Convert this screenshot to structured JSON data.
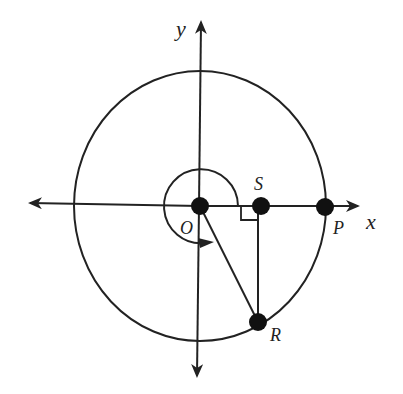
{
  "diagram": {
    "type": "unit-circle-geometry",
    "colors": {
      "stroke": "#222222",
      "background": "#ffffff"
    },
    "axes": {
      "x_label": "x",
      "y_label": "y"
    },
    "points": {
      "origin": {
        "label": "O"
      },
      "S": {
        "label": "S"
      },
      "P": {
        "label": "P"
      },
      "R": {
        "label": "R"
      }
    },
    "annotations": {
      "right_angle_at": "S",
      "angle_arc": "counterclockwise arc from positive x-axis around O to ray OR",
      "segments": [
        "OR",
        "RS"
      ]
    }
  }
}
